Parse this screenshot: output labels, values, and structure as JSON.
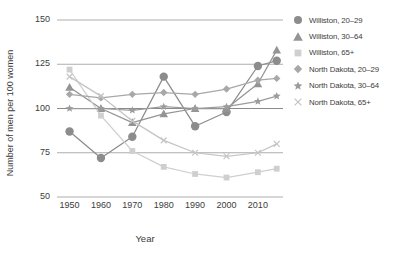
{
  "chart_data": {
    "type": "line",
    "title": "",
    "xlabel": "Year",
    "ylabel": "Number of men per 100 women",
    "x": [
      1950,
      1960,
      1970,
      1980,
      1990,
      2000,
      2010,
      2016
    ],
    "xlim": [
      1946,
      2018
    ],
    "ylim": [
      50,
      150
    ],
    "yticks": [
      50,
      75,
      100,
      125,
      150
    ],
    "xticks": [
      1950,
      1960,
      1970,
      1980,
      1990,
      2000,
      2010
    ],
    "grid": true,
    "legend_position": "right",
    "series": [
      {
        "name": "Williston, 20–29",
        "marker": "circle",
        "color": "#8c8c8c",
        "values": [
          87,
          72,
          84,
          118,
          90,
          98,
          124,
          127
        ]
      },
      {
        "name": "Williston, 30–64",
        "marker": "triangle",
        "color": "#949494",
        "values": [
          112,
          100,
          92,
          97,
          100,
          100,
          114,
          133
        ]
      },
      {
        "name": "Williston, 65+",
        "marker": "square",
        "color": "#cfcfcf",
        "values": [
          122,
          96,
          76,
          67,
          63,
          61,
          64,
          66
        ]
      },
      {
        "name": "North Dakota, 20–29",
        "marker": "diamond",
        "color": "#a8a8a8",
        "values": [
          108,
          106,
          108,
          109,
          108,
          111,
          116,
          117
        ]
      },
      {
        "name": "North Dakota, 30–64",
        "marker": "star",
        "color": "#9c9c9c",
        "values": [
          100,
          100,
          99,
          101,
          100,
          101,
          104,
          107
        ]
      },
      {
        "name": "North Dakota, 65+",
        "marker": "x",
        "color": "#c4c4c4",
        "values": [
          118,
          107,
          93,
          82,
          75,
          73,
          75,
          80
        ]
      }
    ]
  },
  "axes": {
    "y_tick_labels": [
      "150",
      "125",
      "100",
      "75",
      "50"
    ],
    "x_tick_labels": [
      "1950",
      "1960",
      "1970",
      "1980",
      "1990",
      "2000",
      "2010"
    ],
    "y_axis_title": "Number of men per 100 women",
    "x_axis_title": "Year"
  },
  "legend": {
    "items": [
      {
        "label": "Williston, 20–29",
        "marker": "circle-icon",
        "color": "#8c8c8c"
      },
      {
        "label": "Williston, 30–64",
        "marker": "triangle-icon",
        "color": "#949494"
      },
      {
        "label": "Williston, 65+",
        "marker": "square-icon",
        "color": "#cfcfcf"
      },
      {
        "label": "North Dakota, 20–29",
        "marker": "diamond-icon",
        "color": "#a8a8a8"
      },
      {
        "label": "North Dakota, 30–64",
        "marker": "star-icon",
        "color": "#9c9c9c"
      },
      {
        "label": "North Dakota, 65+",
        "marker": "x-icon",
        "color": "#c4c4c4"
      }
    ]
  }
}
